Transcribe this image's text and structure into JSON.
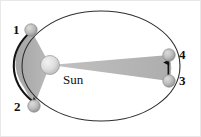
{
  "figure": {
    "type": "orbital-diagram",
    "canvas": {
      "width": 201,
      "height": 137,
      "background": "#ffffff"
    },
    "orbit": {
      "name": "elliptical-orbit",
      "center_x": 101,
      "center_y": 66,
      "radius_x": 79,
      "radius_y": 55,
      "stroke": "#2b2b2b",
      "stroke_width": 1.1,
      "fill": "none"
    },
    "sun": {
      "label": "Sun",
      "center_x": 50,
      "center_y": 65,
      "radius": 9.5,
      "fill": "#d8d8d8",
      "stroke": "#9a9a9a"
    },
    "bodies": [
      {
        "label": "1",
        "center_x": 31,
        "center_y": 30,
        "radius": 6.2,
        "fill": "#b9b9b9",
        "stroke": "#8a8a8a"
      },
      {
        "label": "2",
        "center_x": 34,
        "center_y": 106,
        "radius": 6.2,
        "fill": "#b9b9b9",
        "stroke": "#8a8a8a"
      },
      {
        "label": "4",
        "center_x": 169,
        "center_y": 55,
        "radius": 6.2,
        "fill": "#b9b9b9",
        "stroke": "#8a8a8a"
      },
      {
        "label": "3",
        "center_x": 169,
        "center_y": 81,
        "radius": 6.2,
        "fill": "#b9b9b9",
        "stroke": "#8a8a8a"
      }
    ],
    "sectors": [
      {
        "name": "left-swept-area",
        "description": "wide wedge from Sun to positions 1 and 2 (near perihelion)",
        "fill": "#a8a8a8",
        "opacity": 0.85
      },
      {
        "name": "right-swept-area",
        "description": "narrow wedge from Sun to positions 4 and 3 (near aphelion)",
        "fill": "#b0b0b0",
        "opacity": 0.85
      }
    ],
    "arrows": [
      {
        "name": "left-direction-arrow",
        "description": "orbit travel direction from 1 down to 2 along the left arc",
        "from_label": "1",
        "to_label": "2",
        "color": "#1a1a1a"
      },
      {
        "name": "right-direction-arrow",
        "description": "orbit travel direction from 3 up to 4 along the right arc",
        "from_label": "3",
        "to_label": "4",
        "color": "#1a1a1a"
      }
    ],
    "labels": {
      "pos1": "1",
      "pos2": "2",
      "pos3": "3",
      "pos4": "4",
      "sun": "Sun"
    }
  }
}
